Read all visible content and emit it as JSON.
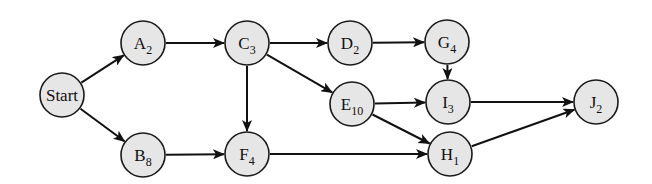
{
  "diagram": {
    "type": "activity-network",
    "nodes": [
      {
        "id": "Start",
        "label": "Start",
        "sub": "",
        "x": 62,
        "y": 95
      },
      {
        "id": "A",
        "label": "A",
        "sub": "2",
        "x": 143,
        "y": 43
      },
      {
        "id": "B",
        "label": "B",
        "sub": "8",
        "x": 143,
        "y": 155
      },
      {
        "id": "C",
        "label": "C",
        "sub": "3",
        "x": 247,
        "y": 43
      },
      {
        "id": "D",
        "label": "D",
        "sub": "2",
        "x": 350,
        "y": 43
      },
      {
        "id": "G",
        "label": "G",
        "sub": "4",
        "x": 447,
        "y": 42
      },
      {
        "id": "E",
        "label": "E",
        "sub": "10",
        "x": 352,
        "y": 104
      },
      {
        "id": "I",
        "label": "I",
        "sub": "3",
        "x": 448,
        "y": 102
      },
      {
        "id": "F",
        "label": "F",
        "sub": "4",
        "x": 247,
        "y": 154
      },
      {
        "id": "H",
        "label": "H",
        "sub": "1",
        "x": 450,
        "y": 154
      },
      {
        "id": "J",
        "label": "J",
        "sub": "2",
        "x": 596,
        "y": 102
      }
    ],
    "edges": [
      [
        "Start",
        "A"
      ],
      [
        "Start",
        "B"
      ],
      [
        "A",
        "C"
      ],
      [
        "B",
        "F"
      ],
      [
        "C",
        "D"
      ],
      [
        "C",
        "E"
      ],
      [
        "C",
        "F"
      ],
      [
        "D",
        "G"
      ],
      [
        "G",
        "I"
      ],
      [
        "E",
        "I"
      ],
      [
        "E",
        "H"
      ],
      [
        "F",
        "H"
      ],
      [
        "I",
        "J"
      ],
      [
        "H",
        "J"
      ]
    ],
    "radius": 22
  }
}
